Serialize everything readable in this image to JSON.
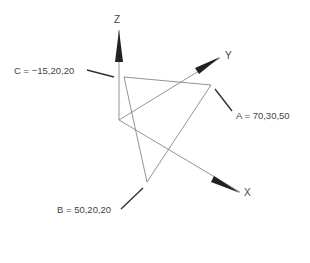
{
  "diagram": {
    "type": "3d-coordinate-triangle",
    "axes": {
      "x_label": "X",
      "y_label": "Y",
      "z_label": "Z"
    },
    "points": [
      {
        "name": "A",
        "label": "A = 70,30,50",
        "coords": [
          70,
          30,
          50
        ]
      },
      {
        "name": "B",
        "label": "B = 50,20,20",
        "coords": [
          50,
          20,
          20
        ]
      },
      {
        "name": "C",
        "label": "C = −15,20,20",
        "coords": [
          -15,
          20,
          20
        ]
      }
    ],
    "colors": {
      "line": "#777777",
      "arrow": "#222222",
      "leader": "#333333",
      "text": "#444444"
    }
  }
}
